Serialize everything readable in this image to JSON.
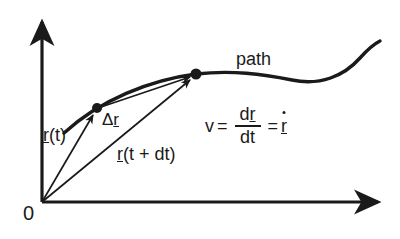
{
  "figure": {
    "title_alt": "Position vector and velocity along a path",
    "background": "#ffffff",
    "ink_color": "#1a1a1a",
    "width": 400,
    "height": 239
  },
  "axes": {
    "origin_label": "0",
    "origin_px": [
      42,
      202
    ],
    "y_axis": {
      "from": [
        42,
        202
      ],
      "to": [
        42,
        16
      ],
      "arrow": true
    },
    "x_axis": {
      "from": [
        42,
        202
      ],
      "to": [
        386,
        202
      ],
      "arrow": true
    }
  },
  "labels": {
    "path": "path",
    "r_of_t": {
      "vector": "r",
      "rest": "(t)"
    },
    "delta_r": {
      "delta": "Δ",
      "vector": "r"
    },
    "r_of_t_plus_dt": {
      "vector": "r",
      "rest": "(t + dt)"
    }
  },
  "formula": {
    "lhs": "v",
    "equals_1": "=",
    "numerator_d": "d",
    "numerator_vector": "r",
    "denominator": "dt",
    "equals_2": "=",
    "rhs_vector": "r",
    "rhs_has_overdot": true,
    "plain_text": "v = dr/dt = ṙ"
  },
  "points": [
    {
      "name": "point-r-t",
      "px": [
        97,
        108
      ]
    },
    {
      "name": "point-r-t-plus-dt",
      "px": [
        196,
        74
      ]
    }
  ],
  "vectors": [
    {
      "name": "vector-r-t",
      "from": [
        42,
        202
      ],
      "to": [
        97,
        108
      ]
    },
    {
      "name": "vector-r-t-plus-dt",
      "from": [
        42,
        202
      ],
      "to": [
        196,
        74
      ]
    },
    {
      "name": "vector-delta-r",
      "from": [
        97,
        108
      ],
      "to": [
        196,
        74
      ]
    }
  ],
  "curve": {
    "name": "path-curve",
    "description": "smooth rising curve flattening in the middle then rising again",
    "d": "M 64 133 C 100 100, 150 80, 196 74 C 232 70, 262 74, 292 80 C 320 86, 344 76, 360 58 C 368 49, 374 44, 380 41"
  }
}
